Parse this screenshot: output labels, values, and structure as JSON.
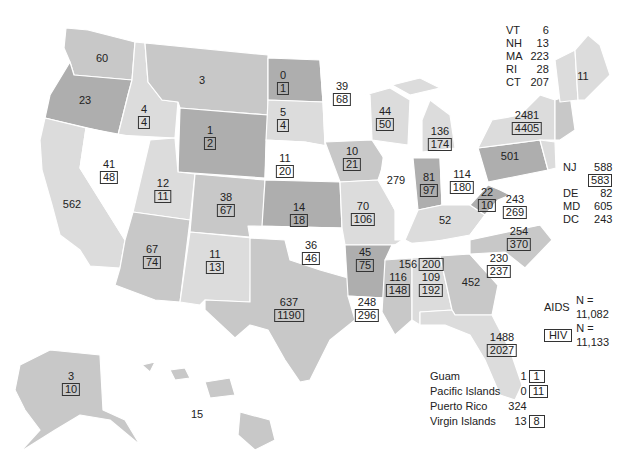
{
  "figure": {
    "title": ""
  },
  "legend": {
    "aids_label": "AIDS",
    "aids_total": "N = 11,082",
    "hiv_label": "HIV",
    "hiv_total": "N = 11,133"
  },
  "states": {
    "WA": {
      "aids": "60",
      "hiv": null
    },
    "OR": {
      "aids": "23",
      "hiv": null
    },
    "CA": {
      "aids": "562",
      "hiv": null
    },
    "ID": {
      "aids": "4",
      "hiv": "4"
    },
    "NV": {
      "aids": "41",
      "hiv": "48"
    },
    "MT": {
      "aids": "3",
      "hiv": null
    },
    "WY": {
      "aids": "1",
      "hiv": "2"
    },
    "UT": {
      "aids": "12",
      "hiv": "11"
    },
    "AZ": {
      "aids": "67",
      "hiv": "74"
    },
    "CO": {
      "aids": "38",
      "hiv": "67"
    },
    "NM": {
      "aids": "11",
      "hiv": "13"
    },
    "ND": {
      "aids": "0",
      "hiv": "1"
    },
    "SD": {
      "aids": "5",
      "hiv": "4"
    },
    "NE": {
      "aids": "11",
      "hiv": "20"
    },
    "KS": {
      "aids": "14",
      "hiv": "18"
    },
    "OK": {
      "aids": "36",
      "hiv": "46"
    },
    "TX": {
      "aids": "637",
      "hiv": "1190"
    },
    "MN": {
      "aids": "39",
      "hiv": "68"
    },
    "IA": {
      "aids": "10",
      "hiv": "21"
    },
    "MO": {
      "aids": "70",
      "hiv": "106"
    },
    "AR": {
      "aids": "45",
      "hiv": "75"
    },
    "LA": {
      "aids": "248",
      "hiv": "296"
    },
    "WI": {
      "aids": "44",
      "hiv": "50"
    },
    "IL": {
      "aids": "279",
      "hiv": null
    },
    "MI": {
      "aids": "136",
      "hiv": "174"
    },
    "IN": {
      "aids": "81",
      "hiv": "97"
    },
    "OH": {
      "aids": "114",
      "hiv": "180"
    },
    "KY": {
      "aids": "52",
      "hiv": null
    },
    "TN": {
      "aids": "156",
      "hiv": "200"
    },
    "MS": {
      "aids": "116",
      "hiv": "148"
    },
    "AL": {
      "aids": "109",
      "hiv": "192"
    },
    "GA": {
      "aids": "452",
      "hiv": null
    },
    "FL": {
      "aids": "1488",
      "hiv": "2027"
    },
    "SC": {
      "aids": "230",
      "hiv": "237"
    },
    "NC": {
      "aids": "254",
      "hiv": "370"
    },
    "VA": {
      "aids": "243",
      "hiv": "269"
    },
    "WV": {
      "aids": "22",
      "hiv": "10"
    },
    "PA": {
      "aids": "501",
      "hiv": null
    },
    "NY": {
      "aids": "2481",
      "hiv": "4405"
    },
    "ME": {
      "aids": "11",
      "hiv": null
    },
    "AK": {
      "aids": "3",
      "hiv": "10"
    },
    "HI": {
      "aids": "15",
      "hiv": null
    }
  },
  "northeast_list": [
    {
      "abbr": "VT",
      "aids": "6"
    },
    {
      "abbr": "NH",
      "aids": "13"
    },
    {
      "abbr": "MA",
      "aids": "223"
    },
    {
      "abbr": "RI",
      "aids": "28"
    },
    {
      "abbr": "CT",
      "aids": "207"
    }
  ],
  "midatlantic_list": [
    {
      "abbr": "NJ",
      "aids": "588",
      "hiv": "583"
    },
    {
      "abbr": "DE",
      "aids": "82"
    },
    {
      "abbr": "MD",
      "aids": "605"
    },
    {
      "abbr": "DC",
      "aids": "243"
    }
  ],
  "territories": [
    {
      "name": "Guam",
      "aids": "1",
      "hiv": "1"
    },
    {
      "name": "Pacific Islands",
      "aids": "0",
      "hiv": "11"
    },
    {
      "name": "Puerto Rico",
      "aids": "324",
      "hiv": null
    },
    {
      "name": "Virgin Islands",
      "aids": "13",
      "hiv": "8"
    }
  ],
  "colors": {
    "white": "#ffffff",
    "light": "#dcdcdc",
    "medium": "#c8c8c8",
    "dark": "#aeaeae",
    "outline": "#333333"
  }
}
